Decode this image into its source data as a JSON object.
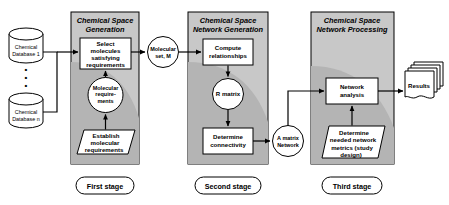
{
  "diagram": {
    "colors": {
      "panel_fill": "#c8c8c8",
      "panel_shade": "#b4b4b4",
      "node_fill": "#ffffff",
      "stroke": "#000000",
      "background": "#ffffff"
    },
    "sources": [
      {
        "id": "db1",
        "label_line1": "Chemical",
        "label_line2": "Database 1"
      },
      {
        "id": "db_n",
        "label_line1": "Chemical",
        "label_line2": "Database n"
      }
    ],
    "ellipsis": "⋮",
    "stages": [
      {
        "id": "stage1",
        "panel_title_line1": "Chemical Space",
        "panel_title_line2": "Generation",
        "caption": "First stage",
        "nodes": [
          {
            "id": "select-molecules",
            "shape": "process",
            "lines": [
              "Select",
              "molecules",
              "satisfying",
              "requirements"
            ]
          },
          {
            "id": "molecular-requirements",
            "shape": "circle",
            "lines": [
              "Molecular",
              "require-",
              "ments"
            ]
          },
          {
            "id": "establish-molecular-requirements",
            "shape": "parallelogram",
            "lines": [
              "Establish",
              "molecular",
              "requirements"
            ]
          }
        ]
      },
      {
        "id": "stage2",
        "panel_title_line1": "Chemical Space",
        "panel_title_line2": "Network  Generation",
        "caption": "Second stage",
        "nodes": [
          {
            "id": "compute-relationships",
            "shape": "process",
            "lines": [
              "Compute",
              "relationships"
            ]
          },
          {
            "id": "r-matrix",
            "shape": "circle",
            "lines": [
              "R matrix"
            ]
          },
          {
            "id": "determine-connectivity",
            "shape": "process",
            "lines": [
              "Determine",
              "connectivity"
            ]
          }
        ]
      },
      {
        "id": "stage3",
        "panel_title_line1": "Chemical Space",
        "panel_title_line2": "Network Processing",
        "caption": "Third stage",
        "nodes": [
          {
            "id": "network-analysis",
            "shape": "process",
            "lines": [
              "Network",
              "analysis"
            ]
          },
          {
            "id": "determine-network-metrics",
            "shape": "parallelogram",
            "lines": [
              "Determine",
              "needed network",
              "metrics (study",
              "design)"
            ]
          }
        ]
      }
    ],
    "connectors": [
      {
        "id": "molecular-set",
        "shape": "circle",
        "lines": [
          "Molecular",
          "set, M"
        ]
      },
      {
        "id": "a-matrix-network",
        "shape": "circle",
        "lines": [
          "A matrix",
          "Network"
        ]
      }
    ],
    "outputs": [
      {
        "id": "results",
        "shape": "document-stack",
        "label": "Results"
      }
    ]
  }
}
